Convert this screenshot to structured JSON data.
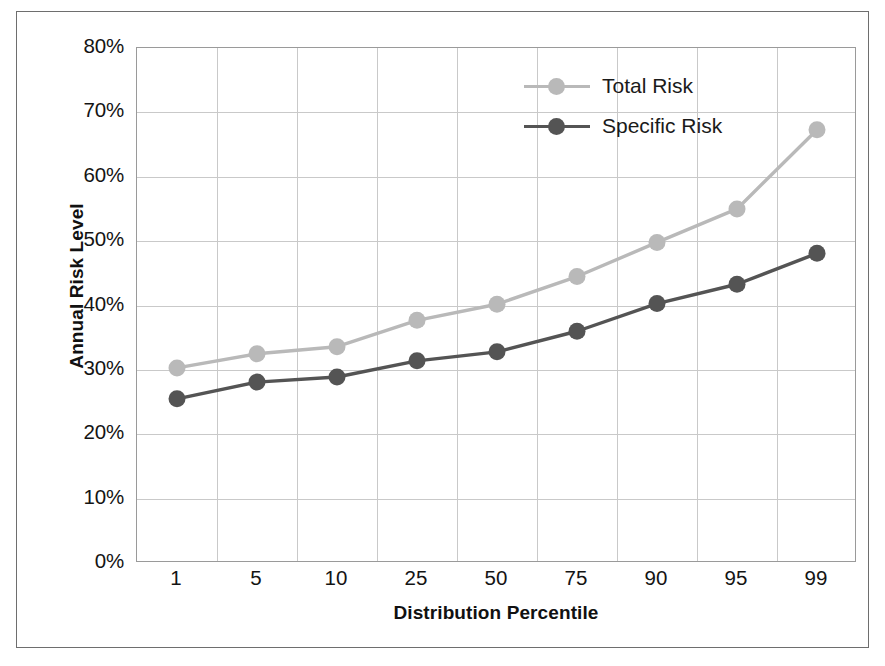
{
  "chart_data": {
    "type": "line",
    "title": "",
    "xlabel": "Distribution Percentile",
    "ylabel": "Annual Risk Level",
    "categories": [
      "1",
      "5",
      "10",
      "25",
      "50",
      "75",
      "90",
      "95",
      "99"
    ],
    "ylim": [
      0,
      80
    ],
    "yticks": [
      "0%",
      "10%",
      "20%",
      "30%",
      "40%",
      "50%",
      "60%",
      "70%",
      "80%"
    ],
    "ytick_values": [
      0,
      10,
      20,
      30,
      40,
      50,
      60,
      70,
      80
    ],
    "grid": true,
    "legend_position": "top-right",
    "series": [
      {
        "name": "Total Risk",
        "color": "#b9b9b9",
        "values": [
          30.3,
          32.5,
          33.6,
          37.7,
          40.2,
          44.5,
          49.8,
          55.0,
          67.3
        ]
      },
      {
        "name": "Specific Risk",
        "color": "#545454",
        "values": [
          25.5,
          28.1,
          28.9,
          31.4,
          32.8,
          36.0,
          40.3,
          43.3,
          48.1
        ]
      }
    ]
  },
  "legend": {
    "entries": [
      {
        "label": "Total Risk"
      },
      {
        "label": "Specific Risk"
      }
    ]
  },
  "colors": {
    "total_risk": "#b9b9b9",
    "specific_risk": "#545454",
    "grid": "#c9c9c9",
    "frame": "#6e6e6e",
    "text": "#141414"
  }
}
